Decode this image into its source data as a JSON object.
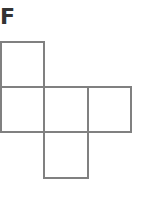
{
  "figure": {
    "label": "F",
    "line_color": "#808080",
    "label_color": "#333333",
    "cell_size": 44,
    "squares": [
      {
        "name": "top",
        "col": 0,
        "row": 0
      },
      {
        "name": "middle-left",
        "col": 0,
        "row": 1
      },
      {
        "name": "middle-center",
        "col": 1,
        "row": 1
      },
      {
        "name": "middle-right",
        "col": 2,
        "row": 1
      },
      {
        "name": "bottom",
        "col": 1,
        "row": 2
      }
    ]
  }
}
